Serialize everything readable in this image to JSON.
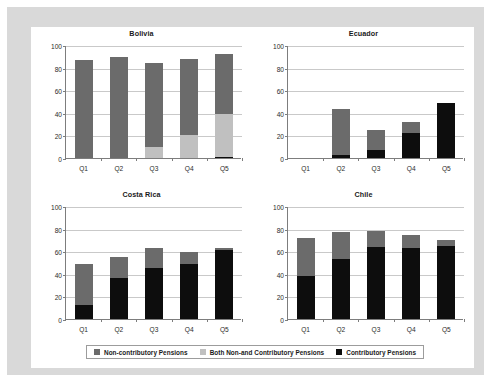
{
  "figure": {
    "background_color": "#ffffff",
    "border_color": "#d9d9d9",
    "panel_color": "#ffffff"
  },
  "legend": {
    "position": "bottom-center",
    "entries": [
      {
        "label": "Non-contributory Pensions",
        "color": "#6b6b6b",
        "key": "non_contributory"
      },
      {
        "label": "Both Non-and Contributory Pensions",
        "color": "#c0c0c0",
        "key": "both"
      },
      {
        "label": "Contributory Pensions",
        "color": "#0d0d0d",
        "key": "contributory"
      }
    ]
  },
  "chart_data": {
    "type": "bar",
    "subtype": "stacked",
    "title": "",
    "xlabel": "",
    "ylabel": "",
    "ylim": [
      0,
      100
    ],
    "yticks": [
      0,
      20,
      40,
      60,
      80,
      100
    ],
    "categories": [
      "Q1",
      "Q2",
      "Q3",
      "Q4",
      "Q5"
    ],
    "grid": true,
    "legend_position": "bottom",
    "series_names": [
      "Contributory Pensions",
      "Both Non-and Contributory Pensions",
      "Non-contributory Pensions"
    ],
    "panels": [
      {
        "title": "Bolivia",
        "series": [
          {
            "name": "Contributory Pensions",
            "color": "#0d0d0d",
            "values": [
              0,
              0,
              0,
              0,
              1
            ]
          },
          {
            "name": "Both Non-and Contributory Pensions",
            "color": "#c0c0c0",
            "values": [
              0,
              0,
              10,
              20,
              38
            ]
          },
          {
            "name": "Non-contributory Pensions",
            "color": "#6b6b6b",
            "values": [
              87,
              89,
              74,
              68,
              53
            ]
          }
        ],
        "totals": [
          87,
          89,
          84,
          88,
          92
        ]
      },
      {
        "title": "Ecuador",
        "series": [
          {
            "name": "Contributory Pensions",
            "color": "#0d0d0d",
            "values": [
              0,
              3,
              7,
              22,
              49
            ]
          },
          {
            "name": "Both Non-and Contributory Pensions",
            "color": "#c0c0c0",
            "values": [
              0,
              0,
              0,
              0,
              0
            ]
          },
          {
            "name": "Non-contributory Pensions",
            "color": "#6b6b6b",
            "values": [
              0,
              40,
              18,
              10,
              0
            ]
          }
        ],
        "totals": [
          0,
          43,
          25,
          32,
          49
        ]
      },
      {
        "title": "Costa Rica",
        "series": [
          {
            "name": "Contributory Pensions",
            "color": "#0d0d0d",
            "values": [
              12,
              36,
              45,
              49,
              61
            ]
          },
          {
            "name": "Both Non-and Contributory Pensions",
            "color": "#c0c0c0",
            "values": [
              0,
              0,
              0,
              0,
              0
            ]
          },
          {
            "name": "Non-contributory Pensions",
            "color": "#6b6b6b",
            "values": [
              37,
              19,
              18,
              10,
              2
            ]
          }
        ],
        "totals": [
          49,
          55,
          63,
          59,
          63
        ]
      },
      {
        "title": "Chile",
        "series": [
          {
            "name": "Contributory Pensions",
            "color": "#0d0d0d",
            "values": [
              38,
              53,
              64,
              63,
              65
            ]
          },
          {
            "name": "Both Non-and Contributory Pensions",
            "color": "#c0c0c0",
            "values": [
              0,
              0,
              0,
              0,
              0
            ]
          },
          {
            "name": "Non-contributory Pensions",
            "color": "#6b6b6b",
            "values": [
              34,
              24,
              14,
              11,
              5
            ]
          }
        ],
        "totals": [
          72,
          77,
          78,
          74,
          70
        ]
      }
    ]
  }
}
